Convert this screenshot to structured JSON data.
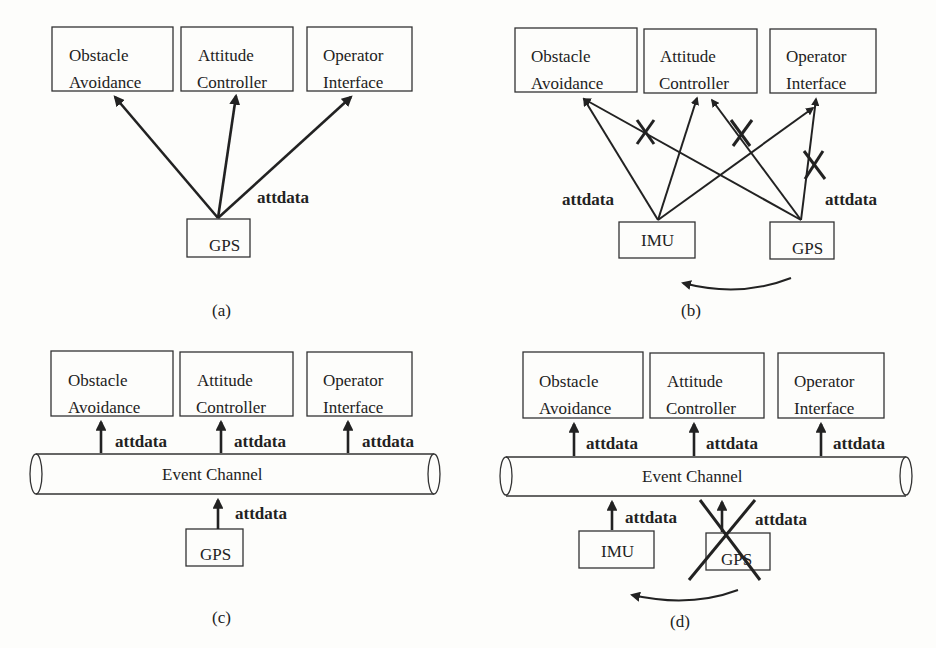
{
  "figure": {
    "panels": [
      {
        "id": "a",
        "caption": "(a)",
        "consumers": [
          {
            "line1": "Obstacle",
            "line2": "Avoidance"
          },
          {
            "line1": "Attitude",
            "line2": "Controller"
          },
          {
            "line1": "Operator",
            "line2": "Interface"
          }
        ],
        "producers": [
          "GPS"
        ],
        "edge_labels": [
          "attdata"
        ]
      },
      {
        "id": "b",
        "caption": "(b)",
        "consumers": [
          {
            "line1": "Obstacle",
            "line2": "Avoidance"
          },
          {
            "line1": "Attitude",
            "line2": "Controller"
          },
          {
            "line1": "Operator",
            "line2": "Interface"
          }
        ],
        "producers": [
          "IMU",
          "GPS"
        ],
        "edge_labels": [
          "attdata",
          "attdata"
        ],
        "note": "GPS connections crossed out; switch-over arrow from GPS to IMU"
      },
      {
        "id": "c",
        "caption": "(c)",
        "consumers": [
          {
            "line1": "Obstacle",
            "line2": "Avoidance"
          },
          {
            "line1": "Attitude",
            "line2": "Controller"
          },
          {
            "line1": "Operator",
            "line2": "Interface"
          }
        ],
        "channel": "Event Channel",
        "producers": [
          "GPS"
        ],
        "edge_labels": [
          "attdata",
          "attdata",
          "attdata",
          "attdata"
        ]
      },
      {
        "id": "d",
        "caption": "(d)",
        "consumers": [
          {
            "line1": "Obstacle",
            "line2": "Avoidance"
          },
          {
            "line1": "Attitude",
            "line2": "Controller"
          },
          {
            "line1": "Operator",
            "line2": "Interface"
          }
        ],
        "channel": "Event Channel",
        "producers": [
          "IMU",
          "GPS"
        ],
        "edge_labels": [
          "attdata",
          "attdata",
          "attdata",
          "attdata",
          "attdata"
        ],
        "note": "GPS crossed out; switch-over arrow from GPS to IMU"
      }
    ]
  }
}
